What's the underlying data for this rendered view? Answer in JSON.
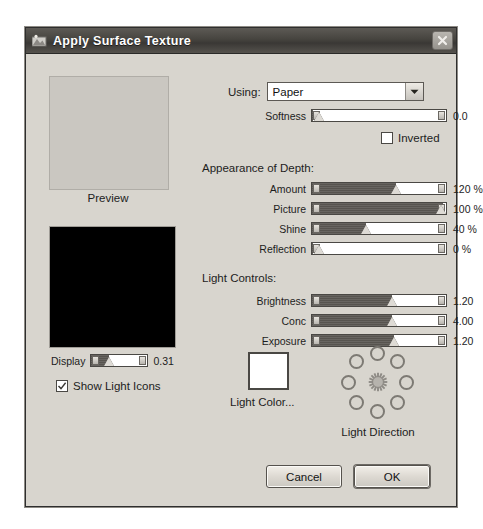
{
  "window": {
    "title": "Apply Surface Texture",
    "icon": "texture-icon",
    "close_label": "×"
  },
  "preview": {
    "label": "Preview",
    "sphere_name": "light-position-sphere"
  },
  "display": {
    "label": "Display",
    "value": "0.31",
    "percent": 31
  },
  "show_light_icons": {
    "label": "Show Light Icons",
    "checked": true
  },
  "using": {
    "label": "Using:",
    "value": "Paper",
    "options": [
      "Paper"
    ]
  },
  "softness": {
    "label": "Softness",
    "value": "0.0",
    "percent": 1
  },
  "inverted": {
    "label": "Inverted",
    "checked": false
  },
  "appearance": {
    "heading": "Appearance of Depth:",
    "sliders": [
      {
        "label": "Amount",
        "value": "120 %",
        "percent": 63
      },
      {
        "label": "Picture",
        "value": "100 %",
        "percent": 98
      },
      {
        "label": "Shine",
        "value": "40 %",
        "percent": 40
      },
      {
        "label": "Reflection",
        "value": "0 %",
        "percent": 1
      }
    ]
  },
  "light_controls": {
    "heading": "Light Controls:",
    "sliders": [
      {
        "label": "Brightness",
        "value": "1.20",
        "percent": 60
      },
      {
        "label": "Conc",
        "value": "4.00",
        "percent": 60
      },
      {
        "label": "Exposure",
        "value": "1.20",
        "percent": 61
      }
    ]
  },
  "light_color": {
    "label": "Light Color...",
    "swatch": "#ffffff"
  },
  "light_direction": {
    "label": "Light Direction",
    "dot_count": 8,
    "center_icon": "sun-icon"
  },
  "buttons": {
    "cancel": "Cancel",
    "ok": "OK"
  },
  "colors": {
    "dialog_bg": "#d8d5ce",
    "titlebar": "#46443f",
    "slider_fill": "#57544f"
  }
}
